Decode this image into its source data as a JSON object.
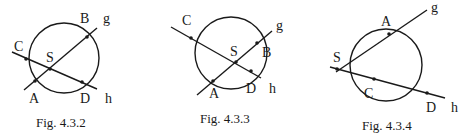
{
  "figures": [
    {
      "caption": "Fig. 4.3.2",
      "circle": {
        "cx": 64,
        "cy": 58,
        "r": 35
      },
      "lines": {
        "g": {
          "label": "g",
          "x1": 24,
          "y1": 90,
          "x2": 97,
          "y2": 28
        },
        "h": {
          "label": "h",
          "x1": 12,
          "y1": 52,
          "x2": 97,
          "y2": 89
        }
      },
      "points": {
        "A": {
          "label": "A",
          "x": 35,
          "y": 81
        },
        "B": {
          "label": "B",
          "x": 87,
          "y": 37
        },
        "C": {
          "label": "C",
          "x": 26,
          "y": 59
        },
        "D": {
          "label": "D",
          "x": 82,
          "y": 82
        },
        "S": {
          "label": "S",
          "x": 50,
          "y": 69
        }
      }
    },
    {
      "caption": "Fig. 4.3.3",
      "circle": {
        "cx": 231,
        "cy": 53,
        "r": 36
      },
      "lines": {
        "g": {
          "label": "g",
          "x1": 197,
          "y1": 95,
          "x2": 272,
          "y2": 31
        },
        "h": {
          "label": "h",
          "x1": 171,
          "y1": 27,
          "x2": 261,
          "y2": 78
        }
      },
      "points": {
        "A": {
          "label": "A",
          "x": 213,
          "y": 81
        },
        "B": {
          "label": "B",
          "x": 257,
          "y": 43
        },
        "C": {
          "label": "C",
          "x": 191,
          "y": 38
        },
        "D": {
          "label": "D",
          "x": 251,
          "y": 71
        },
        "S": {
          "label": "S",
          "x": 236,
          "y": 62
        }
      }
    },
    {
      "caption": "Fig. 4.3.4",
      "circle": {
        "cx": 386,
        "cy": 65,
        "r": 36
      },
      "lines": {
        "g": {
          "label": "g",
          "x1": 336,
          "y1": 72,
          "x2": 427,
          "y2": 10
        },
        "h": {
          "label": "h",
          "x1": 330,
          "y1": 67,
          "x2": 445,
          "y2": 98
        }
      },
      "points": {
        "A": {
          "label": "A",
          "x": 389,
          "y": 34
        },
        "C": {
          "label": "C",
          "x": 374,
          "y": 79
        },
        "D": {
          "label": "D",
          "x": 427,
          "y": 93
        },
        "S": {
          "label": "S",
          "x": 337,
          "y": 69
        }
      }
    }
  ]
}
